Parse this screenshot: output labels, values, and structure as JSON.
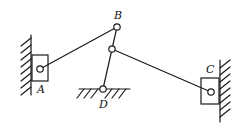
{
  "diagram": {
    "type": "planar-linkage-mechanism",
    "labels": {
      "A": "A",
      "B": "B",
      "C": "C",
      "D": "D"
    },
    "joints": {
      "A": {
        "x": 40,
        "y": 69
      },
      "B": {
        "x": 117,
        "y": 27
      },
      "E": {
        "x": 112,
        "y": 49
      },
      "D": {
        "x": 103,
        "y": 89
      },
      "C": {
        "x": 211,
        "y": 92
      }
    },
    "links": [
      {
        "from": "A",
        "to": "B"
      },
      {
        "from": "B",
        "to": "E"
      },
      {
        "from": "E",
        "to": "D"
      },
      {
        "from": "E",
        "to": "C"
      }
    ],
    "supports": {
      "slider_A_wall": "left vertical guide",
      "slider_C_wall": "right vertical guide",
      "pivot_D_ground": "fixed ground pivot"
    },
    "colors": {
      "stroke": "#1a1a1a",
      "background": "#ffffff"
    }
  }
}
